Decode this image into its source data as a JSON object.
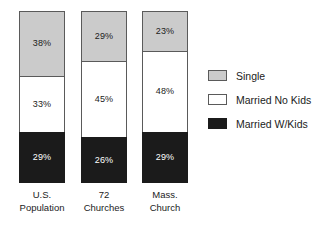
{
  "chart_data": {
    "type": "bar",
    "subtype": "stacked-100-percent",
    "title": "",
    "xlabel": "",
    "ylabel": "",
    "ylim": [
      0,
      100
    ],
    "grid": false,
    "legend_position": "right",
    "categories": [
      "U.S. Population",
      "72 Churches",
      "Mass. Church"
    ],
    "category_lines": [
      [
        "U.S.",
        "Population"
      ],
      [
        "72",
        "Churches"
      ],
      [
        "Mass.",
        "Church"
      ]
    ],
    "series": [
      {
        "name": "Single",
        "color": "#cbcbcb",
        "values": [
          38,
          29,
          23
        ],
        "labels": [
          "38%",
          "29%",
          "23%"
        ]
      },
      {
        "name": "Married No Kids",
        "color": "#ffffff",
        "values": [
          33,
          45,
          48
        ],
        "labels": [
          "33%",
          "45%",
          "48%"
        ]
      },
      {
        "name": "Married W/Kids",
        "color": "#1b1b1b",
        "values": [
          29,
          26,
          29
        ],
        "labels": [
          "29%",
          "26%",
          "29%"
        ]
      }
    ],
    "stack_order_top_to_bottom": [
      "Single",
      "Married No Kids",
      "Married W/Kids"
    ]
  },
  "legend": {
    "items": [
      {
        "label": "Single",
        "swatch": "single"
      },
      {
        "label": "Married No Kids",
        "swatch": "nokids"
      },
      {
        "label": "Married W/Kids",
        "swatch": "wkids"
      }
    ]
  }
}
